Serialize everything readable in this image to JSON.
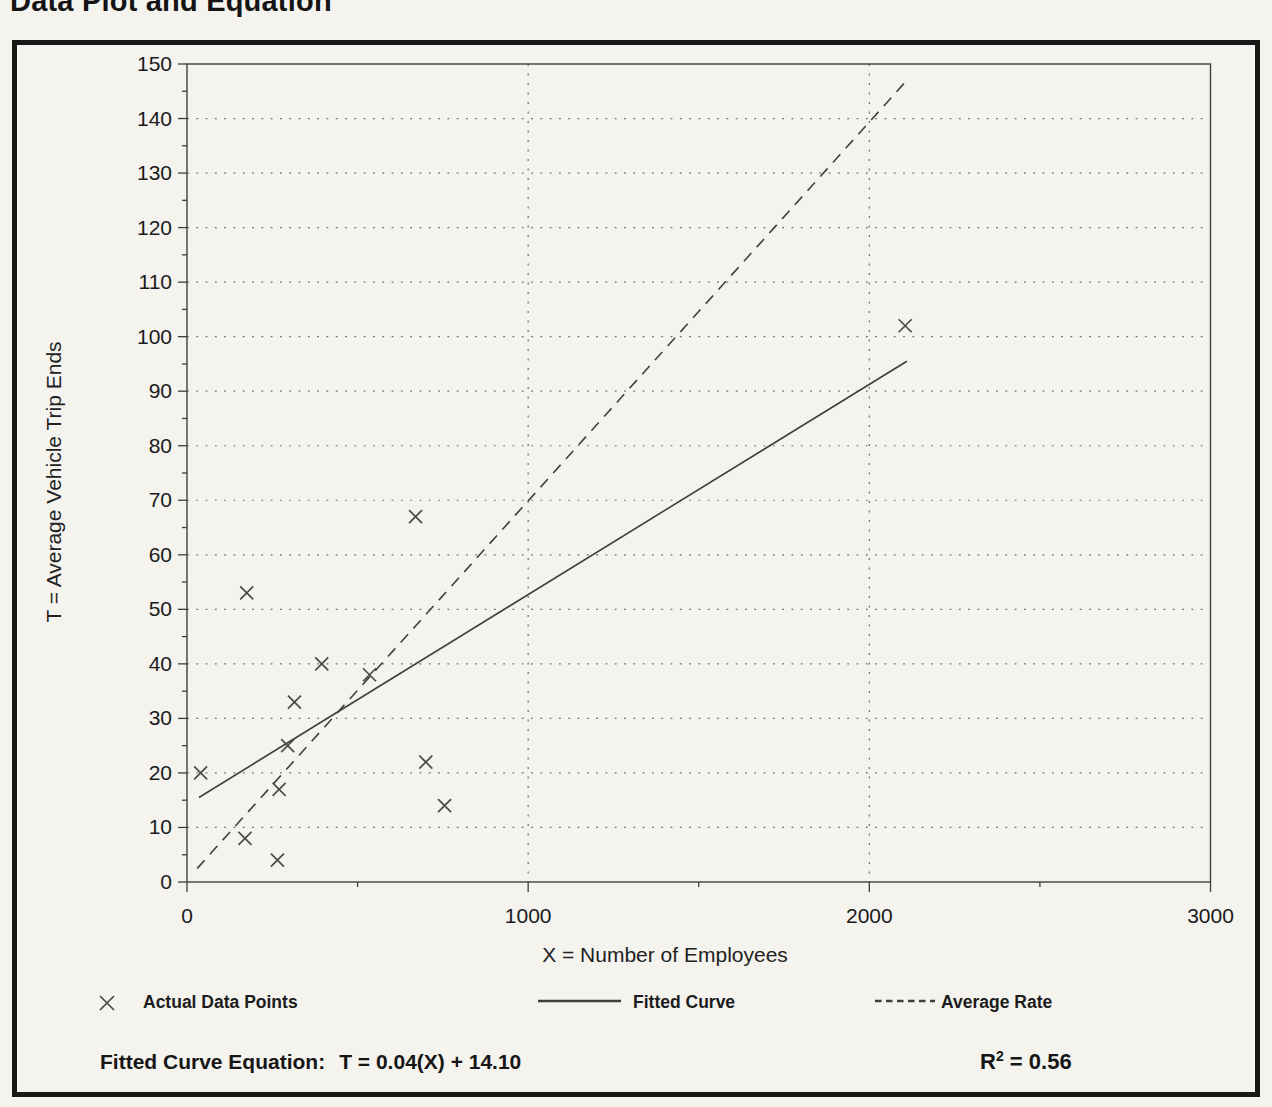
{
  "page": {
    "title": "Data Plot and Equation"
  },
  "chart_data": {
    "type": "scatter",
    "title": "Data Plot and Equation",
    "xlabel": "X = Number of Employees",
    "ylabel": "T = Average Vehicle Trip Ends",
    "xlim": [
      0,
      3000
    ],
    "ylim": [
      0,
      150
    ],
    "x_major_ticks": [
      0,
      1000,
      2000,
      3000
    ],
    "x_minor_ticks": [
      500,
      1500,
      2500
    ],
    "y_major_tick_step": 10,
    "y_minor_tick_step": 5,
    "grid": {
      "horizontal_lines_step": 10,
      "vertical_lines_at": [
        1000,
        2000
      ],
      "style": "dotted"
    },
    "legend_position": "bottom",
    "series": [
      {
        "name": "Actual Data Points",
        "type": "scatter",
        "marker": "x",
        "points": [
          [
            40,
            20
          ],
          [
            170,
            8
          ],
          [
            175,
            53
          ],
          [
            265,
            4
          ],
          [
            270,
            17
          ],
          [
            295,
            25
          ],
          [
            315,
            33
          ],
          [
            395,
            40
          ],
          [
            535,
            38
          ],
          [
            670,
            67
          ],
          [
            700,
            22
          ],
          [
            755,
            14
          ],
          [
            2105,
            102
          ]
        ]
      },
      {
        "name": "Fitted Curve",
        "type": "line",
        "style": "solid",
        "equation": "T = 0.04(X) + 14.10",
        "r_squared": 0.56,
        "x_start": 35,
        "t_start": 15.5,
        "x_end": 2110,
        "t_end": 95.5
      },
      {
        "name": "Average Rate",
        "type": "line",
        "style": "dashed",
        "x_start": 30,
        "t_start": 2.5,
        "x_end": 2110,
        "t_end": 147
      }
    ],
    "colors": {
      "ink": "#3f3f3f",
      "grid": "#6e6e6e",
      "text": "#1a1a1a",
      "paper": "#f4f3ee"
    }
  },
  "legend": {
    "actual_label": "Actual Data Points",
    "fitted_label": "Fitted Curve",
    "average_label": "Average Rate"
  },
  "equation": {
    "label": "Fitted Curve Equation:",
    "formula": "T = 0.04(X) + 14.10",
    "r_base": "R",
    "r_exponent": "2",
    "r_value": "= 0.56"
  }
}
